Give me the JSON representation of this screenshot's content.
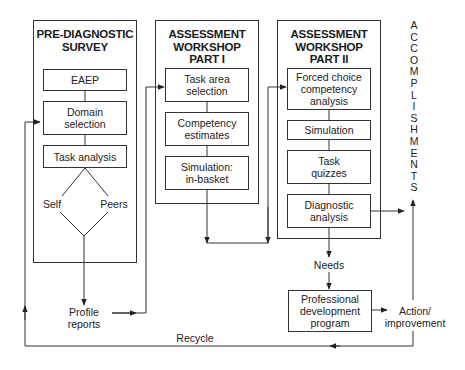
{
  "stages": [
    {
      "title_line1": "PRE-DIAGNOSTIC",
      "title_line2": "SURVEY",
      "steps": [
        "EAEP",
        "Domain selection",
        "Task analysis"
      ],
      "branches": [
        "Self",
        "Peers"
      ]
    },
    {
      "title_line1": "ASSESSMENT",
      "title_line2": "WORKSHOP",
      "title_line3": "PART I",
      "steps": [
        "Task area selection",
        "Competency estimates",
        "Simulation: in-basket"
      ]
    },
    {
      "title_line1": "ASSESSMENT",
      "title_line2": "WORKSHOP",
      "title_line3": "PART II",
      "steps": [
        "Forced choice competency analysis",
        "Simulation",
        "Task quizzes",
        "Diagnostic analysis"
      ]
    }
  ],
  "outputs": {
    "profile_reports": "Profile reports",
    "needs": "Needs",
    "professional_development": "Professional development program",
    "action_improvement": "Action/ improvement",
    "recycle": "Recycle"
  },
  "accomplishments": [
    "A",
    "C",
    "C",
    "O",
    "M",
    "P",
    "L",
    "I",
    "S",
    "H",
    "M",
    "E",
    "N",
    "T",
    "S"
  ],
  "colors": {
    "line": "#333333",
    "text": "#1a1a1a"
  }
}
